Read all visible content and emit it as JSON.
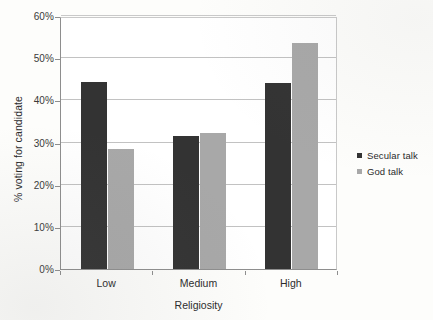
{
  "chart_data": {
    "type": "bar",
    "title": "",
    "categories": [
      "Low",
      "Medium",
      "High"
    ],
    "series": [
      {
        "name": "Secular talk",
        "color": "#333333",
        "values": [
          44.3,
          31.5,
          44.2
        ]
      },
      {
        "name": "God talk",
        "color": "#a8a8a8",
        "values": [
          28.5,
          32.3,
          53.5
        ]
      }
    ],
    "xlabel": "Religiosity",
    "ylabel": "% voting for candidate",
    "ylim": [
      0,
      60
    ],
    "ytick_labels": [
      "0%",
      "10%",
      "20%",
      "30%",
      "40%",
      "50%",
      "60%"
    ],
    "ytick_values": [
      0,
      10,
      20,
      30,
      40,
      50,
      60
    ],
    "grid": true,
    "legend_position": "right"
  },
  "axes": {
    "y_title": "% voting for candidate",
    "x_title": "Religiosity",
    "y_ticks": [
      {
        "label": "60%",
        "value": 60
      },
      {
        "label": "50%",
        "value": 50
      },
      {
        "label": "40%",
        "value": 40
      },
      {
        "label": "30%",
        "value": 30
      },
      {
        "label": "20%",
        "value": 20
      },
      {
        "label": "10%",
        "value": 10
      },
      {
        "label": "0%",
        "value": 0
      }
    ],
    "x_ticks": [
      {
        "label": "Low"
      },
      {
        "label": "Medium"
      },
      {
        "label": "High"
      }
    ]
  },
  "legend": {
    "entries": [
      {
        "label": "Secular talk",
        "color": "#333333"
      },
      {
        "label": "God talk",
        "color": "#a8a8a8"
      }
    ]
  }
}
